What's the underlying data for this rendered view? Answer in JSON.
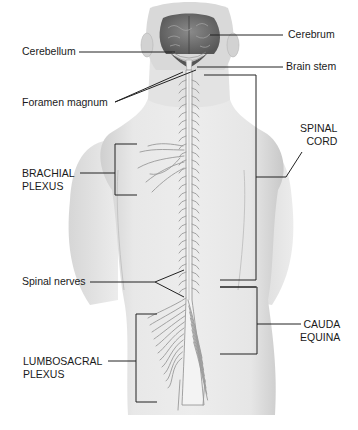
{
  "figure": {
    "colors": {
      "skin": "#e4e4e4",
      "skin_shadow": "#c9c9c9",
      "brain": "#6f6f6f",
      "nerve": "#f4f4f4",
      "line": "#222222",
      "background": "#ffffff"
    }
  },
  "labels": {
    "cerebrum": "Cerebrum",
    "cerebellum": "Cerebellum",
    "brain_stem": "Brain stem",
    "foramen_magnum": "Foramen magnum",
    "spinal_cord": "SPINAL\nCORD",
    "brachial_plexus": "BRACHIAL\nPLEXUS",
    "spinal_nerves": "Spinal nerves",
    "cauda_equina": "CAUDA\nEQUINA",
    "lumbosacral_plexus": "LUMBOSACRAL\nPLEXUS"
  }
}
